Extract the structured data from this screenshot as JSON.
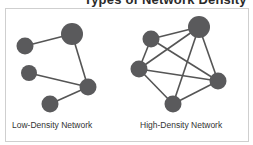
{
  "title": "Types of Network Density",
  "colors": {
    "node": "#5a5a5c",
    "edge": "#555555",
    "frame_border": "#cfcfcf",
    "text": "#333333"
  },
  "networks": [
    {
      "id": "low",
      "label": "Low-Density Network",
      "nodes": [
        {
          "id": "A",
          "x": 72,
          "y": 34,
          "r": 11
        },
        {
          "id": "B",
          "x": 25,
          "y": 46,
          "r": 8.5
        },
        {
          "id": "C",
          "x": 29,
          "y": 73,
          "r": 8
        },
        {
          "id": "D",
          "x": 88,
          "y": 87,
          "r": 8.5
        },
        {
          "id": "E",
          "x": 50,
          "y": 104,
          "r": 8.5
        }
      ],
      "edges": [
        [
          "B",
          "A"
        ],
        [
          "A",
          "D"
        ],
        [
          "C",
          "D"
        ],
        [
          "E",
          "D"
        ]
      ]
    },
    {
      "id": "high",
      "label": "High-Density Network",
      "nodes": [
        {
          "id": "P",
          "x": 199,
          "y": 27,
          "r": 11
        },
        {
          "id": "Q",
          "x": 151,
          "y": 39,
          "r": 8.5
        },
        {
          "id": "R",
          "x": 139,
          "y": 69,
          "r": 8.5
        },
        {
          "id": "S",
          "x": 218,
          "y": 81,
          "r": 8.5
        },
        {
          "id": "T",
          "x": 173,
          "y": 104,
          "r": 8.5
        }
      ],
      "edges": [
        [
          "Q",
          "P"
        ],
        [
          "Q",
          "R"
        ],
        [
          "R",
          "P"
        ],
        [
          "Q",
          "S"
        ],
        [
          "R",
          "S"
        ],
        [
          "R",
          "T"
        ],
        [
          "P",
          "T"
        ],
        [
          "P",
          "S"
        ],
        [
          "T",
          "S"
        ]
      ]
    }
  ]
}
